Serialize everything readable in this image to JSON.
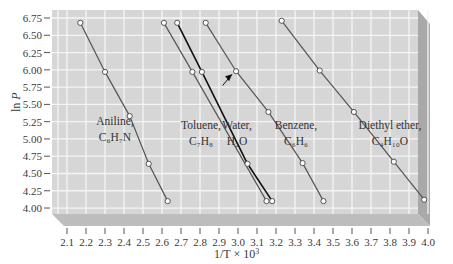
{
  "chart_data": {
    "type": "line",
    "title": "",
    "xlabel": "1/T × 10³",
    "ylabel": "ln P",
    "xlim": [
      2.05,
      4.05
    ],
    "ylim": [
      3.9,
      6.85
    ],
    "x_ticks": [
      "2.1",
      "2.2",
      "2.3",
      "2.4",
      "2.5",
      "2.6",
      "2.7",
      "2.8",
      "2.9",
      "3.0",
      "3.1",
      "3.2",
      "3.3",
      "3.4",
      "3.5",
      "3.6",
      "3.7",
      "3.8",
      "3.9",
      "4.0"
    ],
    "y_ticks": [
      "6.75",
      "6.50",
      "6.25",
      "6.00",
      "5.75",
      "5.50",
      "5.25",
      "5.00",
      "4.75",
      "4.50",
      "4.25",
      "4.00"
    ],
    "grid": true,
    "legend": "inline labels next to each line",
    "series": [
      {
        "name": "Aniline",
        "formula": "C6H7N",
        "label_lines": [
          "Aniline,",
          "C₆H₇N"
        ],
        "color": "#555555",
        "x": [
          2.17,
          2.3,
          2.43,
          2.53,
          2.63
        ],
        "y": [
          6.68,
          5.97,
          5.33,
          4.64,
          4.1
        ]
      },
      {
        "name": "Toluene",
        "formula": "C7H8",
        "label_lines": [
          "Toluene,",
          "C₇H₈"
        ],
        "color": "#555555",
        "x": [
          2.61,
          2.76,
          3.15
        ],
        "y": [
          6.68,
          5.97,
          4.1
        ]
      },
      {
        "name": "Water",
        "formula": "H2O",
        "label_lines": [
          "Water,",
          "H₂O"
        ],
        "color": "#111111",
        "x": [
          2.68,
          2.81,
          3.05,
          3.18
        ],
        "y": [
          6.68,
          5.97,
          4.64,
          4.1
        ]
      },
      {
        "name": "Benzene",
        "formula": "C6H6",
        "label_lines": [
          "Benzene,",
          "C₆H₆"
        ],
        "color": "#555555",
        "x": [
          2.83,
          2.99,
          3.16,
          3.34,
          3.45
        ],
        "y": [
          6.68,
          5.98,
          5.39,
          4.65,
          4.1
        ]
      },
      {
        "name": "Diethyl ether",
        "formula": "C4H10O",
        "label_lines": [
          "Diethyl ether,",
          "C₄H₁₀O"
        ],
        "color": "#555555",
        "x": [
          3.23,
          3.43,
          3.61,
          3.82,
          3.98
        ],
        "y": [
          6.71,
          5.99,
          5.39,
          4.67,
          4.12
        ]
      }
    ],
    "annotations": [
      {
        "type": "arrow",
        "points_to": {
          "x": 2.99,
          "y": 5.98
        },
        "from": {
          "x": 2.94,
          "y": 5.83
        }
      }
    ]
  },
  "labels": {
    "xlabel_main": "1/T × 10",
    "xlabel_sup": "3",
    "ylabel_ln": "ln ",
    "ylabel_p": "P"
  },
  "colors": {
    "plot_bg": "#d6d6d6",
    "grid": "#f4f4f4",
    "side": "#bdbdbd",
    "side_dark": "#a9a9a9",
    "line": "#555555",
    "water_line": "#111111"
  }
}
